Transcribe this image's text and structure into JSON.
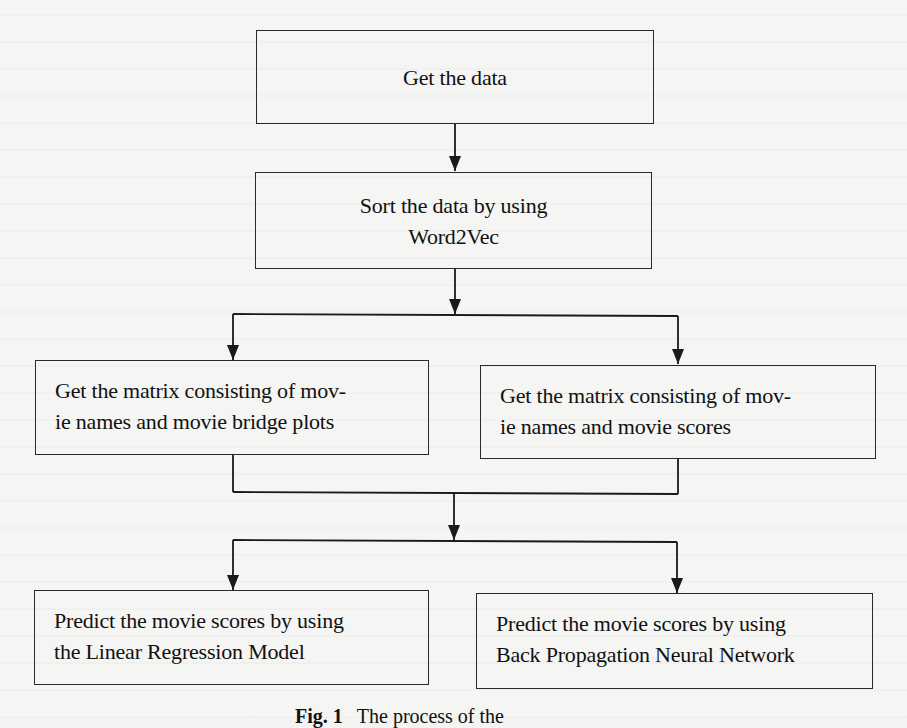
{
  "diagram": {
    "type": "flowchart",
    "nodes": [
      {
        "id": "get-data",
        "lines": [
          "Get the data"
        ]
      },
      {
        "id": "sort-data",
        "lines": [
          "Sort the data by using",
          "Word2Vec"
        ]
      },
      {
        "id": "matrix-plots",
        "lines": [
          "Get the matrix consisting of mov-",
          "ie names and movie bridge plots"
        ]
      },
      {
        "id": "matrix-scores",
        "lines": [
          "Get the matrix consisting of mov-",
          "ie names and movie scores"
        ]
      },
      {
        "id": "predict-lr",
        "lines": [
          "Predict the movie scores by using",
          "the Linear Regression Model"
        ]
      },
      {
        "id": "predict-bpnn",
        "lines": [
          "Predict the movie scores by using",
          "Back Propagation Neural Network"
        ]
      }
    ],
    "edges": [
      {
        "from": "get-data",
        "to": "sort-data"
      },
      {
        "from": "sort-data",
        "to": "matrix-plots"
      },
      {
        "from": "sort-data",
        "to": "matrix-scores"
      },
      {
        "from": "matrix-plots",
        "to": "predict-lr"
      },
      {
        "from": "matrix-plots",
        "to": "predict-bpnn"
      },
      {
        "from": "matrix-scores",
        "to": "predict-lr"
      },
      {
        "from": "matrix-scores",
        "to": "predict-bpnn"
      }
    ],
    "caption": {
      "label": "Fig. 1",
      "text": "The process of the"
    }
  },
  "colors": {
    "stroke": "#2a2a2a",
    "background": "#f5f5f3",
    "text": "#111111"
  }
}
